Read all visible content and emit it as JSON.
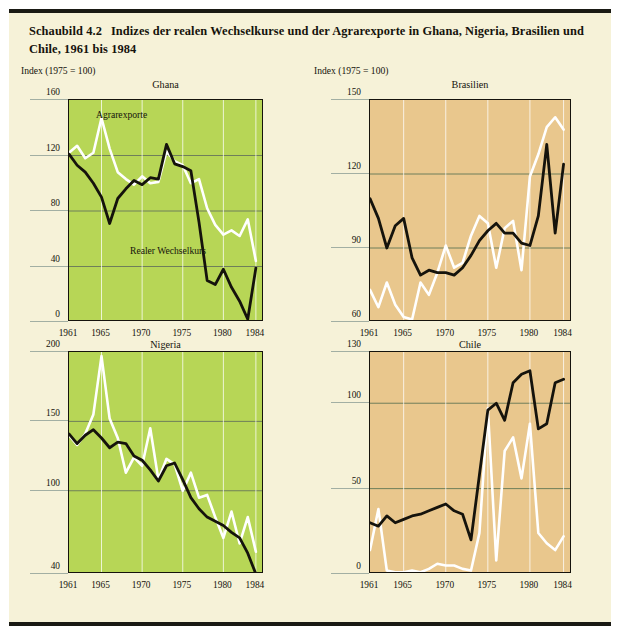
{
  "figure": {
    "number": "Schaubild 4.2",
    "title": "Indizes der realen Wechselkurse und der Agrarexporte in Ghana, Nigeria, Brasilien und Chile, 1961 bis 1984",
    "index_note": "Index (1975 = 100)",
    "series_labels": {
      "white": "Agrarexporte",
      "black": "Realer Wechselkurs"
    },
    "colors": {
      "page_background": "#f6f2d8",
      "green_panel": "#b7d656",
      "tan_panel": "#e9c78d",
      "agrarexporte_line": "#ffffff",
      "wechselkurs_line": "#15130c",
      "rule": "#1a1a14",
      "gridline": "#8a9a8a"
    }
  },
  "chart_data": [
    {
      "type": "line",
      "title": "Ghana",
      "panel_fill": "#b7d656",
      "xlabel": "",
      "ylabel": "Index (1975 = 100)",
      "xlim": [
        1961,
        1985
      ],
      "ylim": [
        0,
        160
      ],
      "yticks": [
        0,
        40,
        80,
        120,
        160
      ],
      "xticks": [
        1961,
        1965,
        1970,
        1975,
        1980,
        1984
      ],
      "gridlines": [
        "y at 40, 80, 120",
        "x at 1965, 1970, 1975, 1980"
      ],
      "legend": "inline annotations",
      "x": [
        1961,
        1962,
        1963,
        1964,
        1965,
        1966,
        1967,
        1968,
        1969,
        1970,
        1971,
        1972,
        1973,
        1974,
        1975,
        1976,
        1977,
        1978,
        1979,
        1980,
        1981,
        1982,
        1983,
        1984
      ],
      "series": [
        {
          "name": "Agrarexporte",
          "color": "#ffffff",
          "values": [
            122,
            127,
            118,
            122,
            147,
            125,
            108,
            103,
            99,
            105,
            100,
            101,
            123,
            116,
            113,
            100,
            103,
            82,
            70,
            63,
            66,
            62,
            74,
            44
          ]
        },
        {
          "name": "Realer Wechselkurs",
          "color": "#15130c",
          "values": [
            121,
            113,
            108,
            100,
            90,
            71,
            89,
            96,
            102,
            99,
            104,
            103,
            128,
            114,
            112,
            109,
            72,
            30,
            27,
            38,
            25,
            15,
            2,
            39
          ]
        }
      ]
    },
    {
      "type": "line",
      "title": "Brasilien",
      "panel_fill": "#e9c78d",
      "xlabel": "",
      "ylabel": "Index (1975 = 100)",
      "xlim": [
        1961,
        1985
      ],
      "ylim": [
        60,
        150
      ],
      "yticks": [
        60,
        90,
        120,
        150
      ],
      "xticks": [
        1961,
        1965,
        1970,
        1975,
        1980,
        1984
      ],
      "gridlines": [
        "y at 90, 120",
        "x at 1965, 1970, 1975, 1980"
      ],
      "x": [
        1961,
        1962,
        1963,
        1964,
        1965,
        1966,
        1967,
        1968,
        1969,
        1970,
        1971,
        1972,
        1973,
        1974,
        1975,
        1976,
        1977,
        1978,
        1979,
        1980,
        1981,
        1982,
        1983,
        1984
      ],
      "series": [
        {
          "name": "Agrarexporte",
          "color": "#ffffff",
          "values": [
            73,
            66,
            76,
            67,
            62,
            61,
            76,
            71,
            80,
            91,
            82,
            84,
            95,
            103,
            100,
            82,
            98,
            101,
            81,
            119,
            128,
            139,
            143,
            138
          ]
        },
        {
          "name": "Realer Wechselkurs",
          "color": "#15130c",
          "values": [
            110,
            102,
            90,
            99,
            102,
            86,
            79,
            81,
            80,
            80,
            79,
            82,
            87,
            93,
            97,
            100,
            96,
            96,
            92,
            91,
            103,
            132,
            96,
            124
          ]
        }
      ]
    },
    {
      "type": "line",
      "title": "Nigeria",
      "panel_fill": "#b7d656",
      "xlabel": "",
      "ylabel": "",
      "xlim": [
        1961,
        1985
      ],
      "ylim": [
        40,
        200
      ],
      "yticks": [
        40,
        100,
        150,
        200
      ],
      "xticks": [
        1961,
        1965,
        1970,
        1975,
        1980,
        1984
      ],
      "gridlines": [
        "y at 100, 150",
        "x at 1965, 1970, 1975, 1980"
      ],
      "x": [
        1961,
        1962,
        1963,
        1964,
        1965,
        1966,
        1967,
        1968,
        1969,
        1970,
        1971,
        1972,
        1973,
        1974,
        1975,
        1976,
        1977,
        1978,
        1979,
        1980,
        1981,
        1982,
        1983,
        1984
      ],
      "series": [
        {
          "name": "Agrarexporte",
          "color": "#ffffff",
          "values": [
            140,
            133,
            141,
            155,
            197,
            152,
            138,
            113,
            124,
            118,
            145,
            108,
            123,
            119,
            100,
            113,
            95,
            97,
            81,
            66,
            85,
            62,
            81,
            56
          ]
        },
        {
          "name": "Realer Wechselkurs",
          "color": "#15130c",
          "values": [
            141,
            134,
            140,
            144,
            138,
            131,
            135,
            134,
            125,
            122,
            115,
            107,
            118,
            120,
            108,
            95,
            87,
            81,
            78,
            75,
            70,
            66,
            55,
            40
          ]
        }
      ]
    },
    {
      "type": "line",
      "title": "Chile",
      "panel_fill": "#e9c78d",
      "xlabel": "",
      "ylabel": "",
      "xlim": [
        1961,
        1985
      ],
      "ylim": [
        0,
        130
      ],
      "yticks": [
        0,
        50,
        100,
        130
      ],
      "xticks": [
        1961,
        1965,
        1970,
        1975,
        1980,
        1984
      ],
      "gridlines": [
        "y at 50, 100",
        "x at 1965, 1970, 1975, 1980"
      ],
      "x": [
        1961,
        1962,
        1963,
        1964,
        1965,
        1966,
        1967,
        1968,
        1969,
        1970,
        1971,
        1972,
        1973,
        1974,
        1975,
        1976,
        1977,
        1978,
        1979,
        1980,
        1981,
        1982,
        1983,
        1984
      ],
      "series": [
        {
          "name": "Agrarexporte",
          "color": "#ffffff",
          "values": [
            14,
            38,
            2,
            1,
            1,
            2,
            1,
            3,
            6,
            5,
            5,
            3,
            2,
            24,
            97,
            8,
            72,
            80,
            56,
            88,
            24,
            18,
            14,
            22
          ]
        },
        {
          "name": "Realer Wechselkurs",
          "color": "#15130c",
          "values": [
            30,
            28,
            34,
            30,
            32,
            34,
            35,
            37,
            39,
            41,
            37,
            35,
            20,
            58,
            96,
            100,
            90,
            112,
            117,
            119,
            85,
            88,
            112,
            114
          ]
        }
      ]
    }
  ]
}
